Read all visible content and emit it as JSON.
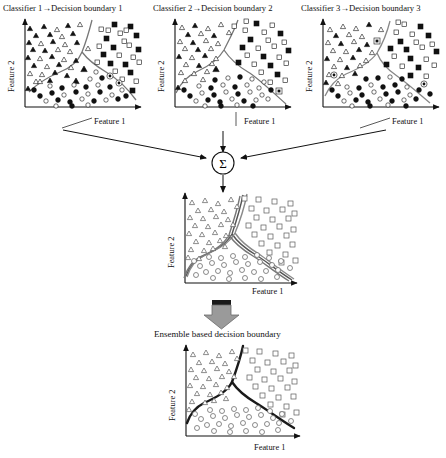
{
  "figure": {
    "kind": "ensemble-decision-boundary-diagram",
    "panel_titles": [
      "Classifier 1→Decision boundary 1",
      "Classifier 2→Decision boundary 2",
      "Classifier 3→Decision boundary 3"
    ],
    "combiner_symbol": "Σ",
    "ensemble_caption": "Ensemble based decision boundary",
    "axis_x_label": "Feature 1",
    "axis_y_label": "Feature 2",
    "colors": {
      "ink": "#111111",
      "boundary_dark": "#1a1a1a",
      "boundary_gray": "#6e6e6e",
      "marker_gray": "#5a5a5a",
      "arrow_block_fill": "#9a9a9a",
      "arrow_block_cap": "#1a1a1a",
      "background": "#ffffff"
    },
    "classes": [
      {
        "name": "triangle-class",
        "marker": "triangle",
        "region": "upper-left"
      },
      {
        "name": "square-class",
        "marker": "square",
        "region": "right"
      },
      {
        "name": "circle-class",
        "marker": "circle",
        "region": "bottom"
      }
    ],
    "panels": [
      {
        "id": "classifier-1",
        "title_index": 0,
        "boundary_style": "thin-gray",
        "markers": "filled-and-hollow"
      },
      {
        "id": "classifier-2",
        "title_index": 1,
        "boundary_style": "thin-gray",
        "markers": "filled-and-hollow"
      },
      {
        "id": "classifier-3",
        "title_index": 2,
        "boundary_style": "thin-gray",
        "markers": "filled-and-hollow"
      },
      {
        "id": "combined",
        "title_index": null,
        "boundary_style": "three-overlaid-gray",
        "markers": "hollow-gray"
      },
      {
        "id": "ensemble",
        "title_index": null,
        "boundary_style": "thick-black",
        "markers": "hollow-gray"
      }
    ],
    "flow": {
      "arrows_to_combiner": 3,
      "arrow_from_combiner": 1,
      "block_arrow_to_ensemble": 1
    }
  }
}
